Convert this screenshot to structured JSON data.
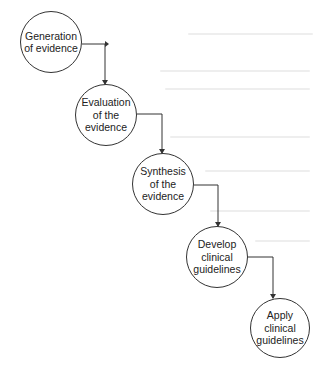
{
  "diagram": {
    "type": "sequential-flow",
    "direction": "top-left to bottom-right staircase",
    "nodes": [
      {
        "id": "n1",
        "label": "Generation\nof evidence",
        "cx": 51,
        "cy": 42,
        "r": 31
      },
      {
        "id": "n2",
        "label": "Evaluation\nof the\nevidence",
        "cx": 106,
        "cy": 115,
        "r": 31
      },
      {
        "id": "n3",
        "label": "Synthesis\nof the\nevidence",
        "cx": 163,
        "cy": 184,
        "r": 31
      },
      {
        "id": "n4",
        "label": "Develop\nclinical\nguidelines",
        "cx": 217,
        "cy": 257,
        "r": 31
      },
      {
        "id": "n5",
        "label": "Apply\nclinical\nguidelines",
        "cx": 280,
        "cy": 328,
        "r": 30
      }
    ],
    "edges": [
      {
        "from": "n1",
        "to": "n2"
      },
      {
        "from": "n2",
        "to": "n3"
      },
      {
        "from": "n3",
        "to": "n4"
      },
      {
        "from": "n4",
        "to": "n5"
      }
    ],
    "colors": {
      "stroke": "#333333",
      "text": "#222222",
      "background": "#ffffff"
    }
  }
}
